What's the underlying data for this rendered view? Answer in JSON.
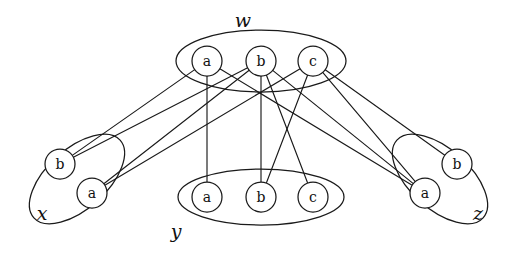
{
  "figure": {
    "type": "diagram",
    "kind": "bipartite-style graph with grouped vertex sets",
    "background_color": "#ffffff",
    "stroke_color": "#1a1a1a"
  },
  "groups": [
    {
      "id": "w",
      "label": "w",
      "label_pos": {
        "x": 243,
        "y": 22
      },
      "ellipse": {
        "cx": 261,
        "cy": 61,
        "rx": 85,
        "ry": 31,
        "rotate": 0
      },
      "nodes": [
        {
          "id": "w.a",
          "label": "a",
          "cx": 207,
          "cy": 61,
          "r": 15
        },
        {
          "id": "w.b",
          "label": "b",
          "cx": 261,
          "cy": 61,
          "r": 15
        },
        {
          "id": "w.c",
          "label": "c",
          "cx": 313,
          "cy": 61,
          "r": 15
        }
      ]
    },
    {
      "id": "x",
      "label": "x",
      "label_pos": {
        "x": 42,
        "y": 215
      },
      "ellipse": {
        "cx": 77,
        "cy": 179,
        "rx": 58,
        "ry": 30,
        "rotate": -42
      },
      "nodes": [
        {
          "id": "x.b",
          "label": "b",
          "cx": 60,
          "cy": 164,
          "r": 15
        },
        {
          "id": "x.a",
          "label": "a",
          "cx": 92,
          "cy": 193,
          "r": 15
        }
      ]
    },
    {
      "id": "y",
      "label": "y",
      "label_pos": {
        "x": 176,
        "y": 233
      },
      "ellipse": {
        "cx": 261,
        "cy": 197,
        "rx": 83,
        "ry": 28,
        "rotate": 0
      },
      "nodes": [
        {
          "id": "y.a",
          "label": "a",
          "cx": 207,
          "cy": 197,
          "r": 15
        },
        {
          "id": "y.b",
          "label": "b",
          "cx": 261,
          "cy": 197,
          "r": 15
        },
        {
          "id": "y.c",
          "label": "c",
          "cx": 313,
          "cy": 197,
          "r": 15
        }
      ]
    },
    {
      "id": "z",
      "label": "z",
      "label_pos": {
        "x": 478,
        "y": 215
      },
      "ellipse": {
        "cx": 440,
        "cy": 179,
        "rx": 58,
        "ry": 30,
        "rotate": 42
      },
      "nodes": [
        {
          "id": "z.b",
          "label": "b",
          "cx": 457,
          "cy": 164,
          "r": 15
        },
        {
          "id": "z.a",
          "label": "a",
          "cx": 425,
          "cy": 193,
          "r": 15
        }
      ]
    }
  ],
  "edges": [
    {
      "from": "w.a",
      "to": "x.b"
    },
    {
      "from": "w.a",
      "to": "y.a"
    },
    {
      "from": "w.a",
      "to": "z.a"
    },
    {
      "from": "w.b",
      "to": "x.b"
    },
    {
      "from": "w.b",
      "to": "x.a"
    },
    {
      "from": "w.b",
      "to": "y.b"
    },
    {
      "from": "w.b",
      "to": "y.c"
    },
    {
      "from": "w.b",
      "to": "z.a"
    },
    {
      "from": "w.c",
      "to": "x.a"
    },
    {
      "from": "w.c",
      "to": "y.b"
    },
    {
      "from": "w.c",
      "to": "z.a"
    },
    {
      "from": "w.c",
      "to": "z.b"
    }
  ]
}
